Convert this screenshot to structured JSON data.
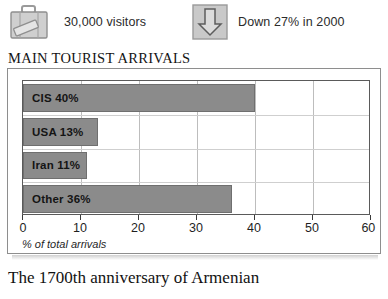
{
  "stats": [
    {
      "icon": "suitcase-icon",
      "label": "30,000 visitors"
    },
    {
      "icon": "down-arrow-icon",
      "label": "Down 27% in 2000"
    }
  ],
  "chart_title": "MAIN TOURIST ARRIVALS",
  "page_caption": "The 1700th anniversary of Armenian",
  "colors": {
    "bar_fill": "#8b8b8b",
    "bar_stroke": "#6f6f6f",
    "panel_border": "#8e8e8e",
    "plot_border": "#5a5a5a",
    "gridline": "#bdbdbd"
  },
  "chart_data": {
    "type": "bar",
    "orientation": "horizontal",
    "title": "MAIN TOURIST ARRIVALS",
    "categories": [
      "CIS",
      "USA",
      "Iran",
      "Other"
    ],
    "values": [
      40,
      13,
      11,
      36
    ],
    "bar_labels": [
      "CIS 40%",
      "USA 13%",
      "Iran 11%",
      "Other 36%"
    ],
    "xlabel": "% of total arrivals",
    "ylabel": "",
    "xlim": [
      0,
      60
    ],
    "xticks": [
      0,
      10,
      20,
      30,
      40,
      50,
      60
    ],
    "xtick_labels": [
      "0",
      "10",
      "20",
      "30",
      "40",
      "50",
      "60"
    ],
    "grid": true,
    "legend": false
  }
}
